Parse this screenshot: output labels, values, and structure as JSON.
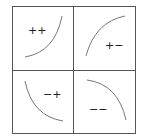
{
  "diagram": {
    "quadrants": [
      {
        "position": "top-left",
        "label": "++",
        "curve": "convex increasing"
      },
      {
        "position": "top-right",
        "label": "+−",
        "curve": "concave increasing"
      },
      {
        "position": "bottom-left",
        "label": "−+",
        "curve": "convex decreasing"
      },
      {
        "position": "bottom-right",
        "label": "−−",
        "curve": "concave decreasing"
      }
    ],
    "colors": {
      "border": "#555555",
      "curve": "#777777",
      "text": "#222222",
      "background": "#ffffff"
    }
  }
}
